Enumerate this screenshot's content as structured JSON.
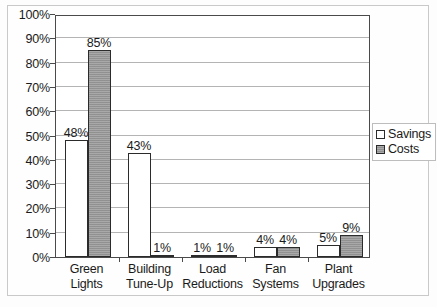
{
  "chart_data": {
    "type": "bar",
    "title": "",
    "subtitle": "",
    "xlabel": "",
    "ylabel": "",
    "categories": [
      "Green Lights",
      "Building Tune-Up",
      "Load Reductions",
      "Fan Systems",
      "Plant Upgrades"
    ],
    "category_lines": [
      [
        "Green",
        "Lights"
      ],
      [
        "Building",
        "Tune-Up"
      ],
      [
        "Load",
        "Reductions"
      ],
      [
        "Fan",
        "Systems"
      ],
      [
        "Plant",
        "Upgrades"
      ]
    ],
    "series": [
      {
        "name": "Savings",
        "values": [
          48,
          43,
          1,
          4,
          5
        ],
        "labels": [
          "48%",
          "43%",
          "1%",
          "4%",
          "5%"
        ],
        "color": "#ffffff"
      },
      {
        "name": "Costs",
        "values": [
          85,
          1,
          1,
          4,
          9
        ],
        "labels": [
          "85%",
          "1%",
          "1%",
          "4%",
          "9%"
        ],
        "color": "#989898"
      }
    ],
    "ylim": [
      0,
      100
    ],
    "ytick_values": [
      0,
      10,
      20,
      30,
      40,
      50,
      60,
      70,
      80,
      90,
      100
    ],
    "ytick_labels": [
      "0%",
      "10%",
      "20%",
      "30%",
      "40%",
      "50%",
      "60%",
      "70%",
      "80%",
      "90%",
      "100%"
    ],
    "grid": true,
    "grid_axis": "y",
    "legend_position": "right-outside",
    "legend_entries": [
      "Savings",
      "Costs"
    ],
    "value_labels_shown": true,
    "value_label_unit": "%"
  },
  "legend": {
    "items": [
      {
        "label": "Savings",
        "swatch": "empty-square-swatch"
      },
      {
        "label": "Costs",
        "swatch": "filled-gray-square-swatch"
      }
    ]
  }
}
